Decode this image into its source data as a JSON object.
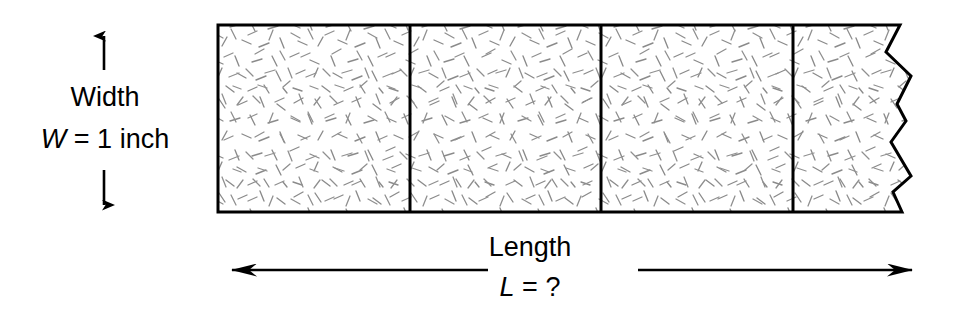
{
  "figure": {
    "background_color": "#ffffff",
    "stroke_color": "#000000",
    "texture_color": "#888888"
  },
  "labels": {
    "width_label": "Width",
    "width_variable": "W",
    "width_equals": "=",
    "width_value": "1 inch",
    "width_value_full": "W = 1 inch",
    "length_label": "Length",
    "length_variable": "L",
    "length_equals": "=",
    "length_value": "?",
    "length_value_full": "L = ?"
  },
  "icons": {
    "width_up_arrow": "arrow-up-icon",
    "width_down_arrow": "arrow-down-icon",
    "length_left_arrow": "arrow-left-icon",
    "length_right_arrow": "arrow-right-icon"
  },
  "ribbon": {
    "left_x": 218,
    "top_y": 25,
    "bottom_y": 212,
    "segment_count": 4,
    "divider_x_positions": [
      410,
      601,
      793
    ],
    "right_edge_type": "torn-jagged",
    "torn_edge_points": "900,25 886,52 911,76 897,104 906,121 891,142 911,176 893,192 902,212",
    "segments": [
      {
        "index": 1,
        "left": 218,
        "right": 410
      },
      {
        "index": 2,
        "left": 410,
        "right": 601
      },
      {
        "index": 3,
        "left": 601,
        "right": 793
      },
      {
        "index": 4,
        "left": 793,
        "right": 905
      }
    ]
  },
  "dimension_arrows": {
    "width": {
      "x": 104,
      "up_arrow_from_y": 70,
      "up_arrow_to_y": 29,
      "down_arrow_from_y": 170,
      "down_arrow_to_y": 212
    },
    "length": {
      "y": 270,
      "left_arrow_from_x": 488,
      "left_arrow_to_x": 218,
      "right_arrow_from_x": 638,
      "right_arrow_to_x": 926
    }
  }
}
